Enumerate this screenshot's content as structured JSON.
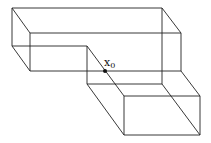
{
  "diagram": {
    "type": "wireframe L-shaped prism",
    "point": {
      "label": "x",
      "subscript": "0",
      "x": 105,
      "y": 71
    },
    "colors": {
      "stroke": "#222222",
      "point": "#111111",
      "background": "#ffffff"
    },
    "edges": [
      [
        12,
        8,
        162,
        8
      ],
      [
        30,
        33,
        181,
        33
      ],
      [
        12,
        8,
        30,
        33
      ],
      [
        162,
        8,
        181,
        33
      ],
      [
        12,
        8,
        12,
        46
      ],
      [
        30,
        33,
        30,
        71
      ],
      [
        162,
        8,
        162,
        84
      ],
      [
        181,
        33,
        181,
        71
      ],
      [
        12,
        46,
        87,
        46
      ],
      [
        12,
        46,
        30,
        71
      ],
      [
        30,
        71,
        181,
        71
      ],
      [
        87,
        46,
        87,
        84
      ],
      [
        87,
        46,
        124,
        96
      ],
      [
        87,
        84,
        162,
        84
      ],
      [
        87,
        84,
        124,
        135
      ],
      [
        162,
        84,
        200,
        135
      ],
      [
        181,
        71,
        200,
        96
      ],
      [
        124,
        96,
        200,
        96
      ],
      [
        124,
        96,
        124,
        135
      ],
      [
        200,
        96,
        200,
        135
      ],
      [
        124,
        135,
        200,
        135
      ]
    ]
  }
}
